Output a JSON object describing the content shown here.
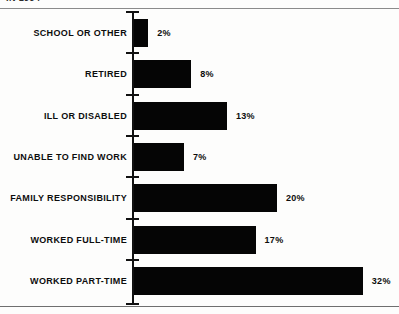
{
  "clipped_title": "IN 1994",
  "chart_data": {
    "type": "bar",
    "orientation": "horizontal",
    "title": "IN 1994",
    "xlabel": "",
    "ylabel": "",
    "xlim": [
      0,
      32
    ],
    "grid": false,
    "legend": false,
    "bar_color": "#050505",
    "background_color": "#fdfdfc",
    "axis_color": "#111111",
    "categories": [
      "SCHOOL OR OTHER",
      "RETIRED",
      "ILL OR DISABLED",
      "UNABLE TO FIND WORK",
      "FAMILY RESPONSIBILITY",
      "WORKED FULL-TIME",
      "WORKED PART-TIME"
    ],
    "values": [
      2,
      8,
      13,
      7,
      20,
      17,
      32
    ],
    "value_labels": [
      "2%",
      "8%",
      "13%",
      "7%",
      "20%",
      "17%",
      "32%"
    ]
  }
}
